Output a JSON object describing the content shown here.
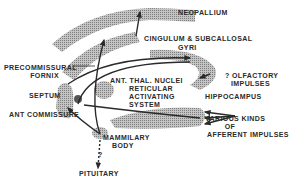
{
  "colors": {
    "ink": "#2a2a2a",
    "shade": "#9a9a9a",
    "background": "#ffffff"
  },
  "labels": {
    "neopallium": "NEOPALLIUM",
    "cingulum_line1": "CINGULUM & SUBCALLOSAL",
    "cingulum_line2": "GYRI",
    "precommissural_line1": "PRECOMMISSURAL",
    "precommissural_line2": "FORNIX",
    "ant_thal_nuclei": "ANT. THAL. NUCLEI",
    "olfactory_line1": "? OLFACTORY",
    "olfactory_line2": "IMPULSES",
    "septum": "SEPTUM",
    "reticular_line1": "RETICULAR",
    "reticular_line2": "ACTIVATING",
    "reticular_line3": "SYSTEM",
    "hippocampus": "HIPPOCAMPUS",
    "ant_commissure": "ANT COMMISSURE",
    "afferent_line1": "VARIOUS KINDS",
    "afferent_line2": "OF",
    "afferent_line3": "AFFERENT IMPULSES",
    "mammilary_line1": "MAMMILARY",
    "mammilary_line2": "BODY",
    "question_mark": "?",
    "pituitary": "PITUITARY"
  }
}
